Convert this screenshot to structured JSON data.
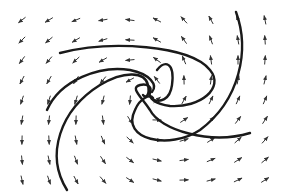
{
  "diagram": {
    "type": "vector-field-phase-portrait",
    "colors": {
      "background": "#ffffff",
      "curve": "#1a1a1a",
      "arrow": "#333333"
    },
    "center": [
      148,
      95
    ],
    "trajectories": [
      "M60,53 C110,40 190,45 210,70 C225,88 200,108 170,106 C155,104 148,98 150,92",
      "M67,190 C45,155 60,110 100,85 C125,70 145,72 148,85 C150,95 146,99 143,95",
      "M236,12 C250,50 240,100 200,130 C170,150 120,140 135,110 C140,98 150,94 153,98",
      "M250,133 C210,145 160,130 150,110 C140,95 130,88 140,85 C148,83 152,88 150,92",
      "M47,110 C60,80 100,65 130,70 C150,74 158,85 152,92",
      "M157,70 C165,60 175,62 172,85 C170,100 160,103 152,99"
    ]
  }
}
